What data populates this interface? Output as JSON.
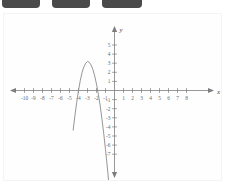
{
  "top_chips": [
    {
      "name": "chip-1"
    },
    {
      "name": "chip-2"
    },
    {
      "name": "chip-3"
    }
  ],
  "chart_data": {
    "type": "line",
    "title": "",
    "xlabel": "x",
    "ylabel": "y",
    "xlim": [
      -11,
      9
    ],
    "ylim": [
      -8,
      6
    ],
    "grid": false,
    "legend": "none",
    "x_ticks": [
      -10,
      -9,
      -8,
      -7,
      -6,
      -5,
      -4,
      -3,
      -2,
      -1,
      1,
      2,
      3,
      4,
      5,
      6,
      7,
      8
    ],
    "x_tick_labels": [
      "-10",
      "-9",
      "-8",
      "-7",
      "-6",
      "-5",
      "-4",
      "-3",
      "-2",
      "-1",
      "1",
      "2",
      "3",
      "4",
      "5",
      "6",
      "7",
      "8"
    ],
    "y_ticks": [
      5,
      4,
      3,
      2,
      1,
      -1,
      -2,
      -3,
      -4,
      -5,
      -6,
      -7
    ],
    "y_tick_labels": [
      "5",
      "4",
      "3",
      "2",
      "1",
      "-1",
      "-2",
      "-3",
      "-4",
      "-5",
      "-6",
      "-7"
    ],
    "axis_arrows": "both",
    "curve_color": "#8a8a8a",
    "axis_color": "#7d7d7d",
    "series": [
      {
        "name": "parabola",
        "vertex": [
          -2,
          3
        ],
        "opens": "down",
        "x_intercepts": [
          -4,
          -0.2
        ],
        "x": [
          -4.6,
          -4.4,
          -4.2,
          -4.0,
          -3.8,
          -3.6,
          -3.4,
          -3.2,
          -3.0,
          -2.8,
          -2.6,
          -2.4,
          -2.2,
          -2.0,
          -1.8,
          -1.6,
          -1.4,
          -1.2,
          -1.0,
          -0.8,
          -0.6,
          -0.4,
          -0.2,
          0.0,
          0.2,
          0.4,
          0.6,
          0.8,
          1.0
        ],
        "y": [
          -4.4,
          -2.8,
          -1.3,
          0.0,
          1.1,
          2.0,
          2.6,
          3.0,
          3.2,
          3.1,
          2.8,
          2.3,
          1.6,
          0.7,
          -0.4,
          -1.6,
          -3.1,
          -4.7,
          -6.5,
          -8.4,
          -10.5,
          -12.7,
          -15.1,
          -17.6,
          -20.3,
          -23.1,
          -26.1,
          -29.2,
          -32.5
        ]
      }
    ]
  }
}
